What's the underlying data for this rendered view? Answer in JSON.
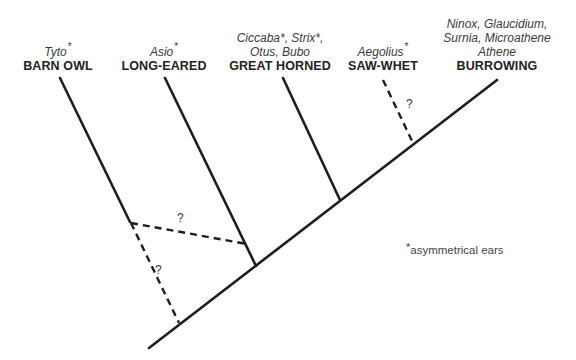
{
  "diagram": {
    "type": "phylogenetic-tree",
    "taxa": [
      {
        "id": "barn",
        "genera": "Tyto",
        "genera_asym": true,
        "common": "BARN OWL"
      },
      {
        "id": "long",
        "genera": "Asio",
        "genera_asym": true,
        "common": "LONG-EARED"
      },
      {
        "id": "great",
        "genera_line1": "Ciccaba*, Strix*,",
        "genera_line2": "Otus, Bubo",
        "common": "GREAT HORNED"
      },
      {
        "id": "saw",
        "genera": "Aegolius",
        "genera_asym": true,
        "common": "SAW-WHET"
      },
      {
        "id": "burrow",
        "genera_line1": "Ninox, Glaucidium,",
        "genera_line2": "Surnia, Microathene",
        "genera_line3": "Athene",
        "common": "BURROWING"
      }
    ],
    "uncertain_marks": [
      "?",
      "?",
      "?"
    ],
    "asterisk": "*",
    "footnote": "asymmetrical ears",
    "colors": {
      "line": "#1e1e1e",
      "text": "#2a2a2a",
      "background": "#ffffff"
    }
  }
}
